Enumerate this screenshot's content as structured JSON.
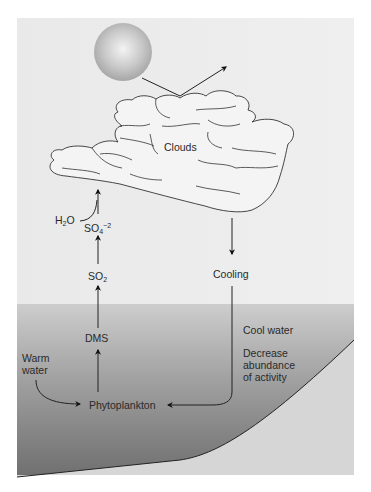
{
  "diagram": {
    "title": "",
    "panels": {
      "sky": {
        "color": "#ececec"
      },
      "ocean": {
        "color_top": "#c4c4c4",
        "color_bottom": "#7a7a7a"
      },
      "seafloor": {
        "color": "#d8d8d8"
      }
    },
    "elements": {
      "sun": {
        "label": "",
        "color": "#bdbdbd"
      },
      "clouds": {
        "label": "Clouds"
      }
    },
    "labels": {
      "h2o": {
        "main": "H",
        "sub": "2",
        "tail": "O"
      },
      "so4": {
        "main": "SO",
        "sub": "4",
        "sup": "−2"
      },
      "so2": {
        "main": "SO",
        "sub": "2"
      },
      "dms": "DMS",
      "warm_water_1": "Warm",
      "warm_water_2": "water",
      "phytoplankton": "Phytoplankton",
      "cooling": "Cooling",
      "cool_water": "Cool water",
      "decrease_1": "Decrease",
      "decrease_2": "abundance",
      "decrease_3": "of activity"
    },
    "arrows": [
      {
        "from": "sun",
        "to": "space",
        "label": "reflection off clouds"
      },
      {
        "from": "Phytoplankton",
        "to": "DMS"
      },
      {
        "from": "DMS",
        "to": "SO2"
      },
      {
        "from": "SO2",
        "to": "SO4-2"
      },
      {
        "from": "SO4-2",
        "to": "Clouds"
      },
      {
        "from": "H2O",
        "to": "Clouds"
      },
      {
        "from": "Clouds",
        "to": "Cooling"
      },
      {
        "from": "Cooling",
        "to": "Phytoplankton"
      },
      {
        "from": "Warm water",
        "to": "Phytoplankton"
      }
    ]
  }
}
